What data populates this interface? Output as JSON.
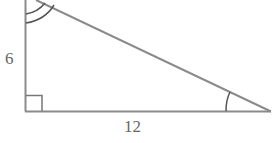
{
  "diagram": {
    "type": "right-triangle",
    "labels": {
      "vertical_leg": "6",
      "horizontal_leg": "12"
    },
    "markers": {
      "right_angle": "bottom-left",
      "double_arc_angle": "top",
      "single_arc_angle": "bottom-right"
    },
    "colors": {
      "stroke": "#8a8a8a",
      "text": "#666666",
      "background": "#ffffff"
    }
  }
}
